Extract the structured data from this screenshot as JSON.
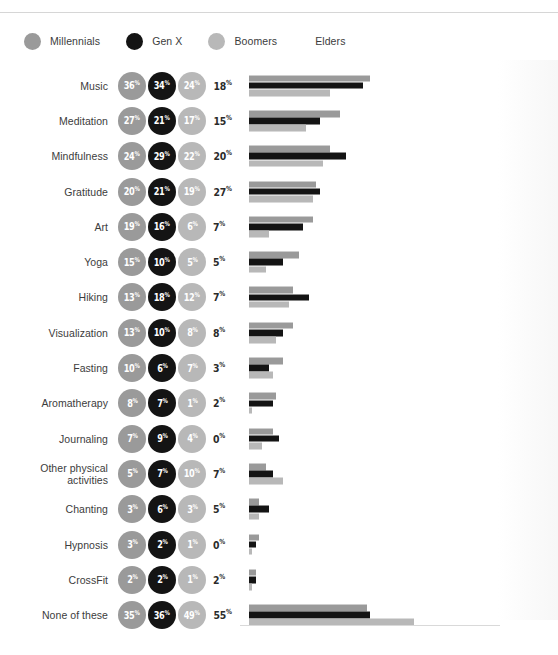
{
  "chart_data": {
    "type": "bar",
    "title": "",
    "xlabel": "",
    "ylabel": "",
    "legend_position": "top-left",
    "grid": false,
    "xlim": [
      0,
      60
    ],
    "value_suffix": "%",
    "series_names": [
      "Millennials",
      "Gen X",
      "Boomers",
      "Elders"
    ],
    "series_colors": [
      "#9a9a9a",
      "#141414",
      "#b8b8b8",
      "#2b2b2b"
    ],
    "categories": [
      "Music",
      "Meditation",
      "Mindfulness",
      "Gratitude",
      "Art",
      "Yoga",
      "Hiking",
      "Visualization",
      "Fasting",
      "Aromatherapy",
      "Journaling",
      "Other physical activities",
      "Chanting",
      "Hypnosis",
      "CrossFit",
      "None of these"
    ],
    "series": [
      {
        "name": "Millennials",
        "values": [
          36,
          27,
          24,
          20,
          19,
          15,
          13,
          13,
          10,
          8,
          7,
          5,
          3,
          3,
          2,
          35
        ]
      },
      {
        "name": "Gen X",
        "values": [
          34,
          21,
          29,
          21,
          16,
          10,
          18,
          10,
          6,
          7,
          9,
          7,
          6,
          2,
          2,
          36
        ]
      },
      {
        "name": "Boomers",
        "values": [
          24,
          17,
          22,
          19,
          6,
          5,
          12,
          8,
          7,
          1,
          4,
          10,
          3,
          1,
          1,
          49
        ]
      },
      {
        "name": "Elders",
        "values": [
          18,
          15,
          20,
          27,
          7,
          5,
          7,
          8,
          3,
          2,
          0,
          7,
          5,
          0,
          2,
          55
        ]
      }
    ]
  },
  "legend": {
    "items": [
      {
        "label": "Millennials",
        "color": "#9a9a9a",
        "has_swatch": true
      },
      {
        "label": "Gen X",
        "color": "#141414",
        "has_swatch": true
      },
      {
        "label": "Boomers",
        "color": "#b8b8b8",
        "has_swatch": true
      },
      {
        "label": "Elders",
        "color": "#2b2b2b",
        "has_swatch": false
      }
    ]
  },
  "rows": [
    {
      "label": "Music",
      "millennials": "36",
      "genx": "34",
      "boomers": "24",
      "elders": "18"
    },
    {
      "label": "Meditation",
      "millennials": "27",
      "genx": "21",
      "boomers": "17",
      "elders": "15"
    },
    {
      "label": "Mindfulness",
      "millennials": "24",
      "genx": "29",
      "boomers": "22",
      "elders": "20"
    },
    {
      "label": "Gratitude",
      "millennials": "20",
      "genx": "21",
      "boomers": "19",
      "elders": "27"
    },
    {
      "label": "Art",
      "millennials": "19",
      "genx": "16",
      "boomers": "6",
      "elders": "7"
    },
    {
      "label": "Yoga",
      "millennials": "15",
      "genx": "10",
      "boomers": "5",
      "elders": "5"
    },
    {
      "label": "Hiking",
      "millennials": "13",
      "genx": "18",
      "boomers": "12",
      "elders": "7"
    },
    {
      "label": "Visualization",
      "millennials": "13",
      "genx": "10",
      "boomers": "8",
      "elders": "8"
    },
    {
      "label": "Fasting",
      "millennials": "10",
      "genx": "6",
      "boomers": "7",
      "elders": "3"
    },
    {
      "label": "Aromatherapy",
      "millennials": "8",
      "genx": "7",
      "boomers": "1",
      "elders": "2"
    },
    {
      "label": "Journaling",
      "millennials": "7",
      "genx": "9",
      "boomers": "4",
      "elders": "0"
    },
    {
      "label": "Other physical activities",
      "millennials": "5",
      "genx": "7",
      "boomers": "10",
      "elders": "7"
    },
    {
      "label": "Chanting",
      "millennials": "3",
      "genx": "6",
      "boomers": "3",
      "elders": "5"
    },
    {
      "label": "Hypnosis",
      "millennials": "3",
      "genx": "2",
      "boomers": "1",
      "elders": "0"
    },
    {
      "label": "CrossFit",
      "millennials": "2",
      "genx": "2",
      "boomers": "1",
      "elders": "2"
    },
    {
      "label": "None of these",
      "millennials": "35",
      "genx": "36",
      "boomers": "49",
      "elders": "55"
    }
  ],
  "style": {
    "millennials_color": "#9a9a9a",
    "genx_color": "#141414",
    "boomers_color": "#b8b8b8",
    "elders_color": "#2b2b2b",
    "percent_symbol": "%",
    "bar_px_per_percent": 3.36
  }
}
